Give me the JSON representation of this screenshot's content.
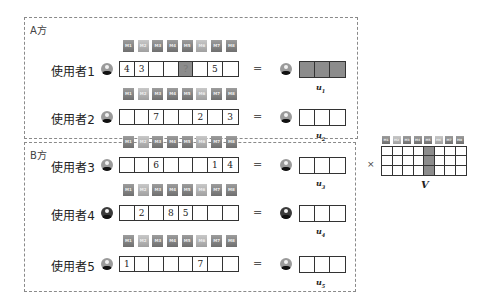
{
  "parties": [
    {
      "label": "A方"
    },
    {
      "label": "B方"
    }
  ],
  "movies": [
    "M1",
    "M2",
    "M3",
    "M4",
    "M5",
    "M6",
    "M7",
    "M8"
  ],
  "users": [
    {
      "label": "使用者1",
      "ratings": [
        "4",
        "3",
        "",
        "",
        "?",
        "",
        "5",
        ""
      ],
      "query_index": 4,
      "u_label": "u",
      "u_sub": "1",
      "u_filled": true,
      "avatar": "avatar-icon"
    },
    {
      "label": "使用者2",
      "ratings": [
        "",
        "",
        "7",
        "",
        "",
        "2",
        "",
        "3"
      ],
      "u_label": "u",
      "u_sub": "2",
      "u_filled": false,
      "avatar": "avatar-icon"
    },
    {
      "label": "使用者3",
      "ratings": [
        "",
        "",
        "6",
        "",
        "",
        "",
        "1",
        "4"
      ],
      "u_label": "u",
      "u_sub": "3",
      "u_filled": false,
      "avatar": "avatar-icon"
    },
    {
      "label": "使用者4",
      "ratings": [
        "",
        "2",
        "",
        "8",
        "5",
        "",
        "",
        ""
      ],
      "u_label": "u",
      "u_sub": "4",
      "u_filled": false,
      "avatar": "avatar-icon"
    },
    {
      "label": "使用者5",
      "ratings": [
        "1",
        "",
        "",
        "",
        "",
        "7",
        "",
        ""
      ],
      "u_label": "u",
      "u_sub": "5",
      "u_filled": false,
      "avatar": "avatar-icon"
    }
  ],
  "equals": "=",
  "times": "×",
  "item_matrix": {
    "label": "V",
    "rows": 3,
    "cols": 8,
    "highlight_col": 4
  },
  "colors": {
    "shade": "#8c8c8c",
    "border": "#333333",
    "dashed": "#8a8a8a"
  }
}
